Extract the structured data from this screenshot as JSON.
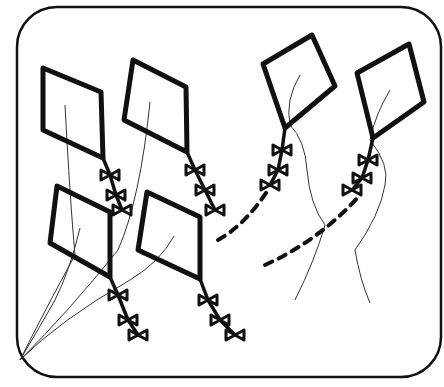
{
  "illustration": {
    "subject": "kites flying",
    "colors": {
      "ink": "#111111",
      "background": "#ffffff"
    },
    "frame": {
      "x": 17,
      "y": 7,
      "width": 424,
      "height": 370,
      "radius": 40
    },
    "kites": [
      {
        "id": "kite-top-left",
        "points": "43,68 101,92 103,158 43,130",
        "tail": "103,158 110,175 116,195 122,210",
        "string_start": "65,105",
        "string_end": "20,360"
      },
      {
        "id": "kite-top-middle",
        "points": "133,60 186,87 187,152 124,120",
        "tail": "187,152 195,170 205,190 215,210",
        "string_start": "150,102",
        "string_end": "20,360"
      },
      {
        "id": "kite-bottom-left",
        "points": "57,186 110,212 110,277 50,243",
        "tail": "110,277 118,295 128,320 138,335",
        "string_start": "80,228",
        "string_end": "20,360"
      },
      {
        "id": "kite-bottom-middle",
        "points": "147,192 200,217 200,279 138,250",
        "tail": "200,279 208,300 220,320 235,335",
        "string_start": "174,236",
        "string_end": "20,360"
      },
      {
        "id": "kite-top-right-1",
        "points": "263,64 312,35 335,86 285,128",
        "tail": "285,128 282,150 278,170 270,185",
        "string_start": "300,75",
        "string_end": "295,300"
      },
      {
        "id": "kite-top-right-2",
        "points": "357,73 409,44 424,102 373,138",
        "tail": "373,138 368,160 362,178 352,190",
        "string_start": "390,90",
        "string_end": "370,303"
      }
    ],
    "dashed_strings": [
      "M 218,240 Q 245,225 268,190",
      "M 265,265 Q 320,240 360,195"
    ]
  }
}
